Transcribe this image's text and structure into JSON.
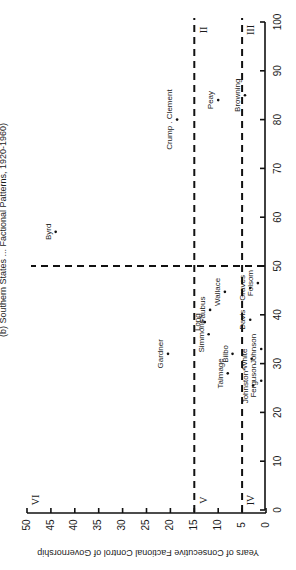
{
  "chart_data": {
    "type": "scatter",
    "title": "(b) Southern States ... Factional Patterns, 1920-1960)",
    "orientation": "rotated-90",
    "xlabel": "",
    "ylabel": "Years of Consecutive Factional Control of Governorship",
    "xlim": [
      0,
      100
    ],
    "ylim": [
      0,
      50
    ],
    "x_ticks": [
      0,
      10,
      20,
      30,
      40,
      50,
      60,
      70,
      80,
      90,
      100
    ],
    "y_ticks": [
      0,
      5,
      10,
      15,
      20,
      25,
      30,
      35,
      40,
      45,
      50
    ],
    "grid": false,
    "reference_lines": [
      {
        "axis": "y",
        "value": 15,
        "style": "dashed"
      },
      {
        "axis": "y",
        "value": 5,
        "style": "dashed"
      },
      {
        "axis": "x",
        "value": 50,
        "style": "dashed"
      }
    ],
    "zones": [
      {
        "label": "II",
        "x": 100,
        "y": 15
      },
      {
        "label": "III",
        "x": 100,
        "y": 5
      },
      {
        "label": "IV",
        "x": 0,
        "y": 5
      },
      {
        "label": "V",
        "x": 0,
        "y": 15
      },
      {
        "label": "VI",
        "x": 0,
        "y": 50
      }
    ],
    "points": [
      {
        "name": "Byrd",
        "x": 57,
        "y": 44
      },
      {
        "name": "Gardner",
        "x": 32,
        "y": 20.5
      },
      {
        "name": "Crump . Clement",
        "x": 80,
        "y": 18.6
      },
      {
        "name": "Peay",
        "x": 84,
        "y": 10
      },
      {
        "name": "Browning",
        "x": 85,
        "y": 4.4
      },
      {
        "name": "Long",
        "x": 38.5,
        "y": 12.8
      },
      {
        "name": "Simmons*",
        "x": 36,
        "y": 12
      },
      {
        "name": "Faubus",
        "x": 41,
        "y": 11.7
      },
      {
        "name": "Wallace",
        "x": 44.7,
        "y": 8.6
      },
      {
        "name": "Talmage",
        "x": 28,
        "y": 8
      },
      {
        "name": "Bilbo",
        "x": 32,
        "y": 7
      },
      {
        "name": "White",
        "x": 31,
        "y": 3
      },
      {
        "name": "Johnston*",
        "x": 25.5,
        "y": 2.7
      },
      {
        "name": "Ferguson",
        "x": 26.5,
        "y": 1
      },
      {
        "name": "Johnson",
        "x": 33,
        "y": 1
      },
      {
        "name": "Davis",
        "x": 39,
        "y": 3.3
      },
      {
        "name": "Graves",
        "x": 45.5,
        "y": 3.3
      },
      {
        "name": "Folsom",
        "x": 46.5,
        "y": 1.7
      }
    ]
  },
  "header": {
    "title_fragment": "(b) Southern States ... Factional Patterns, 1920-1960)"
  }
}
